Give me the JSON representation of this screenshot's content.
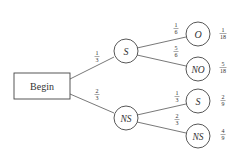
{
  "diagram": {
    "type": "probability-tree",
    "root": {
      "label": "Begin"
    },
    "level1": [
      {
        "id": "S",
        "label": "S",
        "edge_prob": {
          "num": "1",
          "den": "3"
        }
      },
      {
        "id": "NS",
        "label": "NS",
        "edge_prob": {
          "num": "2",
          "den": "3"
        }
      }
    ],
    "level2": [
      {
        "parent": "S",
        "label": "O",
        "edge_prob": {
          "num": "1",
          "den": "6"
        },
        "outcome_prob": {
          "num": "1",
          "den": "18"
        }
      },
      {
        "parent": "S",
        "label": "NO",
        "edge_prob": {
          "num": "5",
          "den": "6"
        },
        "outcome_prob": {
          "num": "5",
          "den": "18"
        }
      },
      {
        "parent": "NS",
        "label": "S",
        "edge_prob": {
          "num": "1",
          "den": "3"
        },
        "outcome_prob": {
          "num": "2",
          "den": "9"
        }
      },
      {
        "parent": "NS",
        "label": "NS",
        "edge_prob": {
          "num": "2",
          "den": "3"
        },
        "outcome_prob": {
          "num": "4",
          "den": "9"
        }
      }
    ],
    "colors": {
      "stroke": "#444444",
      "text": "#333333",
      "background": "#ffffff"
    }
  }
}
